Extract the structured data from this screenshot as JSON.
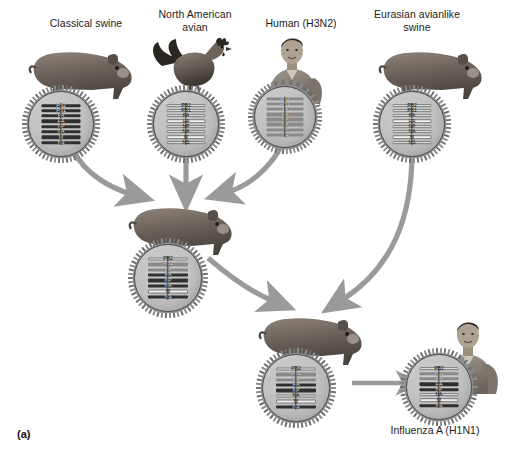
{
  "figure": {
    "panel_label": "(a)",
    "background_color": "#ffffff",
    "ink_color": "#1b1b1b",
    "arrow_color": "#9a9a9a"
  },
  "gene_segments": [
    "PB2",
    "PB1",
    "PA",
    "HA",
    "NP",
    "NA",
    "M",
    "NS"
  ],
  "nodes": {
    "classical_swine": {
      "label": "Classical swine",
      "host_icon": "pig-icon",
      "segment_shading": [
        "dark",
        "dark",
        "dark",
        "dark",
        "dark",
        "dark",
        "dark",
        "dark"
      ]
    },
    "north_american_avian": {
      "label": "North American\navian",
      "host_icon": "rooster-icon",
      "segment_shading": [
        "light",
        "light",
        "light",
        "light",
        "light",
        "light",
        "light",
        "light"
      ]
    },
    "human_h3n2": {
      "label": "Human (H3N2)",
      "host_icon": "human-icon",
      "segment_shading": [
        "mid",
        "mid",
        "mid",
        "mid",
        "mid",
        "mid",
        "mid",
        "mid"
      ]
    },
    "eurasian_avianlike_swine": {
      "label": "Eurasian avianlike\nswine",
      "host_icon": "pig-icon",
      "segment_shading": [
        "light",
        "light",
        "light",
        "light",
        "light",
        "light",
        "light",
        "light"
      ]
    },
    "triple_reassortant_swine": {
      "label": "",
      "host_icon": "pig-icon",
      "segment_shading": [
        "light",
        "mid",
        "mid",
        "dark",
        "dark",
        "dark",
        "light",
        "dark"
      ]
    },
    "reassortant_swine": {
      "label": "",
      "host_icon": "pig-icon",
      "segment_shading": [
        "light",
        "mid",
        "mid",
        "dark",
        "dark",
        "light",
        "light",
        "dark"
      ]
    },
    "pandemic_h1n1": {
      "label": "Influenza A (H1N1)",
      "host_icon": "human-icon",
      "segment_shading": [
        "light",
        "mid",
        "mid",
        "dark",
        "dark",
        "light",
        "light",
        "dark"
      ]
    }
  },
  "arrows": [
    {
      "name": "classical-swine-to-triple-reassortant",
      "from": "classical_swine",
      "to": "triple_reassortant_swine",
      "style": "curved"
    },
    {
      "name": "avian-to-triple-reassortant",
      "from": "north_american_avian",
      "to": "triple_reassortant_swine",
      "style": "straight"
    },
    {
      "name": "human-h3n2-to-triple-reassortant",
      "from": "human_h3n2",
      "to": "triple_reassortant_swine",
      "style": "curved"
    },
    {
      "name": "triple-reassortant-to-reassortant",
      "from": "triple_reassortant_swine",
      "to": "reassortant_swine",
      "style": "curved"
    },
    {
      "name": "eurasian-swine-to-reassortant",
      "from": "eurasian_avianlike_swine",
      "to": "reassortant_swine",
      "style": "curved"
    },
    {
      "name": "reassortant-to-pandemic-h1n1",
      "from": "reassortant_swine",
      "to": "pandemic_h1n1",
      "style": "straight"
    }
  ]
}
